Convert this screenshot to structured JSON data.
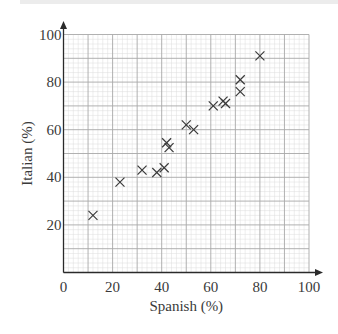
{
  "chart_data": {
    "type": "scatter",
    "title": "",
    "xlabel": "Spanish (%)",
    "ylabel": "Italian (%)",
    "xlim": [
      0,
      100
    ],
    "ylim": [
      0,
      100
    ],
    "x_ticks": [
      0,
      20,
      40,
      60,
      80,
      100
    ],
    "y_ticks": [
      20,
      40,
      60,
      80,
      100
    ],
    "x_tick_labels": [
      "0",
      "20",
      "40",
      "60",
      "80",
      "100"
    ],
    "y_tick_labels": [
      "20",
      "40",
      "60",
      "80",
      "100"
    ],
    "grid": true,
    "grid_major_step": 10,
    "grid_minor_step": 2,
    "marker": "x",
    "colors": {
      "axis": "#2a2a2a",
      "major_grid": "#a8a8a8",
      "minor_grid": "#dcdcdc",
      "marker": "#3a3a3a",
      "text": "#3a3a3a"
    },
    "points": [
      {
        "x": 12,
        "y": 24
      },
      {
        "x": 23,
        "y": 38
      },
      {
        "x": 32,
        "y": 43
      },
      {
        "x": 38,
        "y": 42
      },
      {
        "x": 41,
        "y": 44
      },
      {
        "x": 42,
        "y": 54.5
      },
      {
        "x": 43,
        "y": 52.5
      },
      {
        "x": 50,
        "y": 62
      },
      {
        "x": 53,
        "y": 60
      },
      {
        "x": 61,
        "y": 70
      },
      {
        "x": 65,
        "y": 72
      },
      {
        "x": 66,
        "y": 71
      },
      {
        "x": 72,
        "y": 81
      },
      {
        "x": 72,
        "y": 76
      },
      {
        "x": 80,
        "y": 91
      }
    ]
  }
}
